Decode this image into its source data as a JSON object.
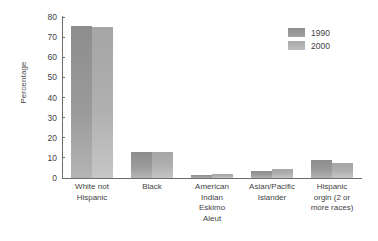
{
  "chart_data": {
    "type": "bar",
    "title": "",
    "xlabel": "",
    "ylabel": "Percentage",
    "ylim": [
      0,
      80
    ],
    "yticks": [
      0,
      10,
      20,
      30,
      40,
      50,
      60,
      70,
      80
    ],
    "grid": false,
    "legend_position": "top-right",
    "categories": [
      "White not Hispanic",
      "Black",
      "American Indian Eskimo Aleut",
      "Asian/Pacific Islander",
      "Hispanic orgin (2 or more races)"
    ],
    "category_lines": [
      [
        "White not",
        "Hispanic"
      ],
      [
        "Black"
      ],
      [
        "American",
        "Indian",
        "Eskimo",
        "Aleut"
      ],
      [
        "Asian/Pacific",
        "Islander"
      ],
      [
        "Hispanic",
        "orgin (2 or",
        "more races)"
      ]
    ],
    "series": [
      {
        "name": "1990",
        "color": "#8d8d8d",
        "values": [
          75.5,
          12.8,
          1.5,
          3.5,
          9.0
        ]
      },
      {
        "name": "2000",
        "color": "#a8a8a8",
        "values": [
          75.0,
          12.8,
          2.0,
          4.5,
          7.5
        ]
      }
    ]
  },
  "legend": {
    "items": [
      {
        "label": "1990"
      },
      {
        "label": "2000"
      }
    ]
  },
  "axis": {
    "y_title": "Percentage",
    "y_tick_labels": [
      "80",
      "70",
      "60",
      "50",
      "40",
      "30",
      "20",
      "10",
      "0"
    ]
  }
}
